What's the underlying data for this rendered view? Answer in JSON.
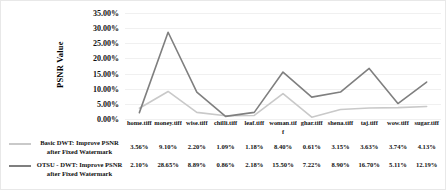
{
  "chart_data": {
    "type": "line",
    "title": "",
    "xlabel": "",
    "ylabel": "PSNR Value",
    "ylim": [
      0,
      35
    ],
    "grid": true,
    "legend_position": "left",
    "categories": [
      "home.tiff",
      "money.tiff",
      "wise.tiff",
      "chilli.tiff",
      "leaf.tiff",
      "woman.tiff",
      "ghar.tiff",
      "shena.tiff",
      "taj.tiff",
      "wow.tiff",
      "sugar.tiff"
    ],
    "ytick_labels": [
      "35.00%",
      "30.00%",
      "25.00%",
      "20.00%",
      "15.00%",
      "10.00%",
      "5.00%",
      "0.00%"
    ],
    "ytick_values": [
      35,
      30,
      25,
      20,
      15,
      10,
      5,
      0
    ],
    "series": [
      {
        "name": "Basic DWT: Improve PSNR  after Fixed Watermark",
        "color": "#c9c9c9",
        "values": [
          3.56,
          9.1,
          2.2,
          1.09,
          1.18,
          8.4,
          0.61,
          3.15,
          3.63,
          3.74,
          4.13
        ],
        "labels": [
          "3.56%",
          "9.10%",
          "2.20%",
          "1.09%",
          "1.18%",
          "8.40%",
          "0.61%",
          "3.15%",
          "3.63%",
          "3.74%",
          "4.13%"
        ]
      },
      {
        "name": "OTSU - DWT: Improve PSNR after Fixed Watermark",
        "color": "#7f7f7f",
        "values": [
          2.1,
          28.65,
          8.89,
          0.86,
          2.18,
          15.5,
          7.22,
          8.9,
          16.7,
          5.11,
          12.19
        ],
        "labels": [
          "2.10%",
          "28.65%",
          "8.89%",
          "0.86%",
          "2.18%",
          "15.50%",
          "7.22%",
          "8.90%",
          "16.70%",
          "5.11%",
          "12.19%"
        ]
      }
    ]
  },
  "legend": {
    "items": [
      {
        "label": "Basic DWT: Improve PSNR  after Fixed Watermark",
        "color": "#c9c9c9"
      },
      {
        "label": "OTSU - DWT: Improve PSNR after Fixed Watermark",
        "color": "#7f7f7f"
      }
    ]
  }
}
